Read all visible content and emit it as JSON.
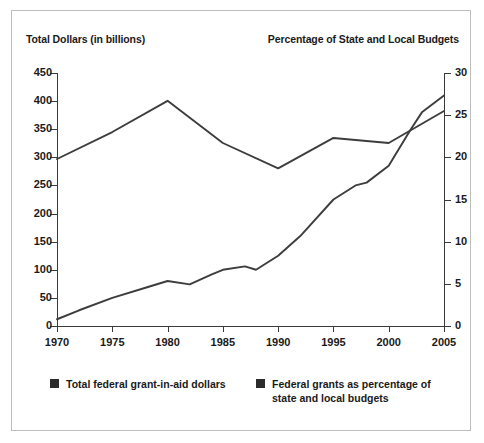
{
  "chart_data": {
    "type": "line",
    "title": "",
    "xlabel": "",
    "left_axis_title": "Total Dollars (in billions)",
    "right_axis_title": "Percentage of State and Local Budgets",
    "grid": false,
    "legend_position": "bottom",
    "x": [
      1970,
      1975,
      1980,
      1985,
      1990,
      1995,
      2000,
      2005
    ],
    "xlim": [
      1970,
      2005
    ],
    "xticks": [
      "1970",
      "1975",
      "1980",
      "1985",
      "1990",
      "1995",
      "2000",
      "2005"
    ],
    "ylim_left": [
      0,
      450
    ],
    "yticks_left": [
      "0",
      "50",
      "100",
      "150",
      "200",
      "250",
      "300",
      "350",
      "400",
      "450"
    ],
    "ylim_right": [
      0,
      30
    ],
    "yticks_right": [
      "0",
      "5",
      "10",
      "15",
      "20",
      "25",
      "30"
    ],
    "series": [
      {
        "name": "Total federal grant-in-aid dollars",
        "axis": "left",
        "color": "#3d3d3d",
        "x": [
          1970,
          1972,
          1975,
          1978,
          1980,
          1982,
          1984,
          1985,
          1987,
          1988,
          1990,
          1992,
          1995,
          1997,
          1998,
          2000,
          2002,
          2003,
          2005
        ],
        "values": [
          12,
          28,
          50,
          68,
          80,
          74,
          92,
          100,
          106,
          100,
          125,
          160,
          225,
          250,
          255,
          285,
          350,
          380,
          410
        ]
      },
      {
        "name": "Federal grants as percentage of state and local budgets",
        "axis": "right",
        "color": "#3d3d3d",
        "x": [
          1970,
          1975,
          1980,
          1985,
          1990,
          1995,
          2000,
          2005
        ],
        "values": [
          19.8,
          23.0,
          26.7,
          21.7,
          18.7,
          22.3,
          21.7,
          25.5
        ]
      }
    ]
  },
  "legend": [
    {
      "label": "Total federal grant-in-aid dollars",
      "swatch_color": "#2b2b2b"
    },
    {
      "label": "Federal grants as percentage of state and local budgets",
      "swatch_color": "#2b2b2b"
    }
  ]
}
